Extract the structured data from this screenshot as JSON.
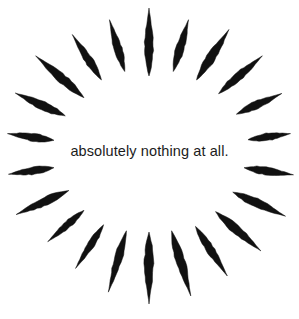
{
  "artwork": {
    "title": "absolutely nothing at all.",
    "type": "radial-sunburst-illustration",
    "caption_text": "absolutely nothing at all.",
    "background_color": "#ffffff",
    "ink_color": "#111111",
    "text_color": "#1b1b1b",
    "canvas": {
      "width": 299,
      "height": 319
    },
    "center": {
      "x": 149,
      "y": 154
    },
    "ray_count": 22,
    "rays": [
      {
        "name": "ray-0",
        "angle_deg": 270.0,
        "inner_radius": 78,
        "outer_radius": 146,
        "half_width": 4.2
      },
      {
        "name": "ray-1",
        "angle_deg": 286.4,
        "inner_radius": 86,
        "outer_radius": 140,
        "half_width": 4.0
      },
      {
        "name": "ray-2",
        "angle_deg": 302.7,
        "inner_radius": 88,
        "outer_radius": 148,
        "half_width": 4.4
      },
      {
        "name": "ray-3",
        "angle_deg": 319.1,
        "inner_radius": 92,
        "outer_radius": 150,
        "half_width": 4.0
      },
      {
        "name": "ray-4",
        "angle_deg": 335.5,
        "inner_radius": 96,
        "outer_radius": 146,
        "half_width": 3.8
      },
      {
        "name": "ray-5",
        "angle_deg": 351.8,
        "inner_radius": 100,
        "outer_radius": 143,
        "half_width": 3.6
      },
      {
        "name": "ray-6",
        "angle_deg": 8.2,
        "inner_radius": 96,
        "outer_radius": 146,
        "half_width": 3.8
      },
      {
        "name": "ray-7",
        "angle_deg": 24.5,
        "inner_radius": 92,
        "outer_radius": 150,
        "half_width": 4.2
      },
      {
        "name": "ray-8",
        "angle_deg": 40.9,
        "inner_radius": 88,
        "outer_radius": 148,
        "half_width": 4.2
      },
      {
        "name": "ray-9",
        "angle_deg": 57.3,
        "inner_radius": 86,
        "outer_radius": 145,
        "half_width": 4.0
      },
      {
        "name": "ray-10",
        "angle_deg": 73.6,
        "inner_radius": 80,
        "outer_radius": 148,
        "half_width": 4.4
      },
      {
        "name": "ray-11",
        "angle_deg": 90.0,
        "inner_radius": 78,
        "outer_radius": 150,
        "half_width": 4.4
      },
      {
        "name": "ray-12",
        "angle_deg": 106.4,
        "inner_radius": 80,
        "outer_radius": 144,
        "half_width": 3.8
      },
      {
        "name": "ray-13",
        "angle_deg": 122.7,
        "inner_radius": 84,
        "outer_radius": 136,
        "half_width": 3.4
      },
      {
        "name": "ray-14",
        "angle_deg": 139.1,
        "inner_radius": 86,
        "outer_radius": 134,
        "half_width": 3.4
      },
      {
        "name": "ray-15",
        "angle_deg": 155.5,
        "inner_radius": 88,
        "outer_radius": 146,
        "half_width": 4.0
      },
      {
        "name": "ray-16",
        "angle_deg": 171.8,
        "inner_radius": 96,
        "outer_radius": 142,
        "half_width": 3.6
      },
      {
        "name": "ray-17",
        "angle_deg": 188.2,
        "inner_radius": 96,
        "outer_radius": 143,
        "half_width": 3.8
      },
      {
        "name": "ray-18",
        "angle_deg": 204.5,
        "inner_radius": 92,
        "outer_radius": 147,
        "half_width": 4.2
      },
      {
        "name": "ray-19",
        "angle_deg": 220.9,
        "inner_radius": 86,
        "outer_radius": 150,
        "half_width": 4.4
      },
      {
        "name": "ray-20",
        "angle_deg": 237.3,
        "inner_radius": 88,
        "outer_radius": 142,
        "half_width": 3.8
      },
      {
        "name": "ray-21",
        "angle_deg": 253.6,
        "inner_radius": 86,
        "outer_radius": 140,
        "half_width": 3.8
      }
    ]
  }
}
